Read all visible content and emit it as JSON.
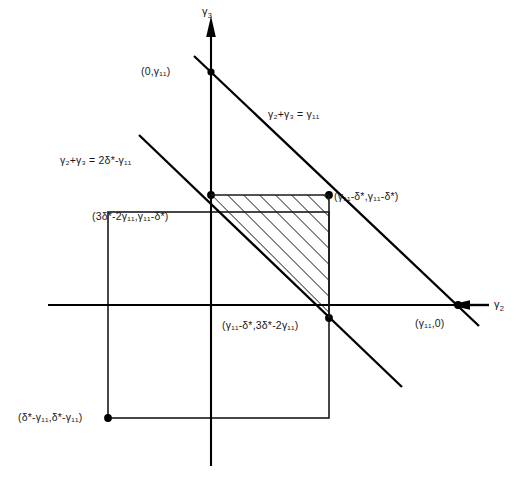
{
  "figure": {
    "type": "geometric-diagram"
  },
  "axes": {
    "x_label": "γ₂",
    "x_label_base": "γ",
    "x_label_sub": "2",
    "y_label_base": "γ",
    "y_label_sub": "3",
    "origin_x": 211,
    "origin_y": 305
  },
  "lines": [
    {
      "name": "upper-constraint-line",
      "equation_parts": {
        "lhs_a": "γ",
        "lhs_a_sub": "2",
        "plus": "+",
        "lhs_b": "γ",
        "lhs_b_sub": "3",
        "eq": "=",
        "rhs": "γ",
        "rhs_sub": "11"
      },
      "equation_text": "γ₂+γ₃ = γ₁₁"
    },
    {
      "name": "lower-constraint-line",
      "equation_parts": {
        "lhs_a": "γ",
        "lhs_a_sub": "2",
        "plus": "+",
        "lhs_b": "γ",
        "lhs_b_sub": "3",
        "eq": "=",
        "rhs_num": "2",
        "rhs_delta": "δ*",
        "rhs_minus": "-",
        "rhs_gamma": "γ",
        "rhs_gamma_sub": "11"
      },
      "equation_text": "γ₂+γ₃ = 2δ*-γ₁₁"
    }
  ],
  "points": [
    {
      "name": "y-axis-intercept",
      "label": "(0,γ₁₁)",
      "x": 211,
      "y": 72
    },
    {
      "name": "upper-left-vertex",
      "label": "(3δ*-2γ₁₁,γ₁₁-δ*)",
      "x": 211,
      "y": 195
    },
    {
      "name": "upper-right-vertex",
      "label": "(γ₁₁-δ*,γ₁₁-δ*)",
      "x": 329,
      "y": 195
    },
    {
      "name": "lower-right-vertex",
      "label": "(γ₁₁-δ*,3δ*-2γ₁₁)",
      "x": 329,
      "y": 318
    },
    {
      "name": "x-axis-intercept",
      "label": "(γ₁₁,0)",
      "x": 458,
      "y": 305
    },
    {
      "name": "square-bottom-left-corner",
      "label": "(δ*-γ₁₁,δ*-γ₁₁)",
      "x": 108,
      "y": 418
    }
  ],
  "square": {
    "name": "bounding-square",
    "left": 108,
    "top": 212,
    "right": 329,
    "bottom": 418
  },
  "region": {
    "name": "feasible-region",
    "fill": "hatched",
    "hatch_angle_deg": 45,
    "vertices": [
      [
        211,
        195
      ],
      [
        329,
        195
      ],
      [
        329,
        318
      ]
    ]
  },
  "colors": {
    "stroke": "#000000",
    "text": "#1a1a1a",
    "background": "#ffffff"
  }
}
